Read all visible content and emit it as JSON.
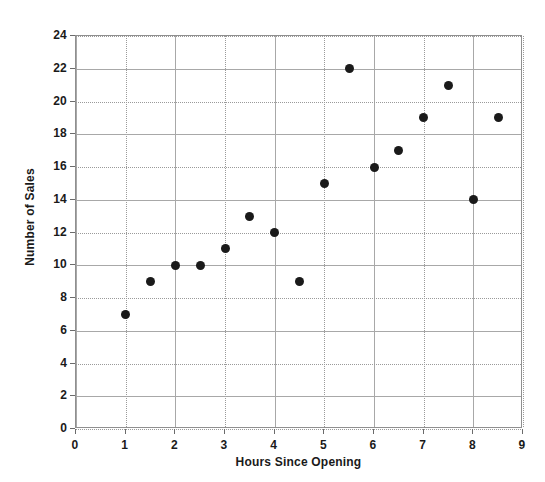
{
  "chart_data": {
    "type": "scatter",
    "title": "",
    "xlabel": "Hours Since Opening",
    "ylabel": "Number of Sales",
    "xlim": [
      0,
      9
    ],
    "ylim": [
      0,
      24
    ],
    "xticks": [
      0,
      1,
      2,
      3,
      4,
      5,
      6,
      7,
      8,
      9
    ],
    "yticks": [
      0,
      2,
      4,
      6,
      8,
      10,
      12,
      14,
      16,
      18,
      20,
      22,
      24
    ],
    "xtick_labels": [
      "0",
      "1",
      "2",
      "3",
      "4",
      "5",
      "6",
      "7",
      "8",
      "9"
    ],
    "ytick_labels": [
      "0",
      "2",
      "4",
      "6",
      "8",
      "10",
      "12",
      "14",
      "16",
      "18",
      "20",
      "22",
      "24"
    ],
    "grid": true,
    "grid_color": "#a8a8a8",
    "legend": false,
    "marker_color": "#1a1a1a",
    "plot_background": "#ffffff",
    "figure_background": "#ffffff",
    "x": [
      1,
      1.5,
      2,
      2.5,
      3,
      3.5,
      4,
      4.5,
      5,
      5.5,
      6,
      6.5,
      7,
      7.5,
      8,
      8.5
    ],
    "y": [
      7,
      9,
      10,
      10,
      11,
      13,
      12,
      9,
      15,
      22,
      16,
      17,
      19,
      21,
      14,
      19
    ],
    "points": [
      {
        "x": 1,
        "y": 7
      },
      {
        "x": 1.5,
        "y": 9
      },
      {
        "x": 2,
        "y": 10
      },
      {
        "x": 2.5,
        "y": 10
      },
      {
        "x": 3,
        "y": 11
      },
      {
        "x": 3.5,
        "y": 13
      },
      {
        "x": 4,
        "y": 12
      },
      {
        "x": 4.5,
        "y": 9
      },
      {
        "x": 5,
        "y": 15
      },
      {
        "x": 5.5,
        "y": 22
      },
      {
        "x": 6,
        "y": 16
      },
      {
        "x": 6.5,
        "y": 17
      },
      {
        "x": 7,
        "y": 19
      },
      {
        "x": 7.5,
        "y": 21
      },
      {
        "x": 8,
        "y": 14
      },
      {
        "x": 8.5,
        "y": 19
      }
    ]
  }
}
